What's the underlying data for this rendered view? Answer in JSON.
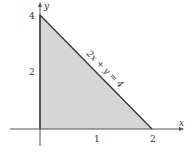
{
  "diagram": {
    "type": "shaded-region",
    "axes": {
      "x_label": "x",
      "y_label": "y"
    },
    "ticks": {
      "x": [
        "1",
        "2"
      ],
      "y": [
        "2",
        "4"
      ]
    },
    "line_label": "2x + y = 4",
    "vertices": [
      [
        0,
        0
      ],
      [
        2,
        0
      ],
      [
        0,
        4
      ]
    ],
    "colors": {
      "fill": "#d6d6d6",
      "line": "#333333",
      "axis": "#555555"
    }
  }
}
